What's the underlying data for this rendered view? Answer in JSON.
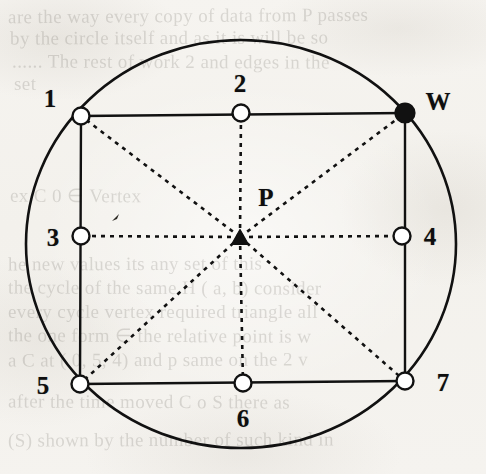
{
  "figure": {
    "canvas": {
      "width": 486,
      "height": 474
    },
    "background_color": "#f5f3ef",
    "ink_color": "#111111",
    "marker_fill_open": "#ffffff",
    "marker_fill_solid": "#111111"
  },
  "geometry": {
    "circle": {
      "cx": 241,
      "cy": 244,
      "rx": 215,
      "ry": 204
    },
    "rectangle": {
      "left": 81,
      "right": 404,
      "top": 115,
      "bottom": 383
    },
    "center_point": {
      "x": 240,
      "y": 237
    }
  },
  "points": [
    {
      "id": "p1",
      "label": "1",
      "marker": "open-circle",
      "x": 81,
      "y": 116,
      "label_x": 50,
      "label_y": 98
    },
    {
      "id": "p2",
      "label": "2",
      "marker": "open-circle",
      "x": 241,
      "y": 113,
      "label_x": 240,
      "label_y": 83
    },
    {
      "id": "pW",
      "label": "W",
      "marker": "filled-circle",
      "x": 405,
      "y": 113,
      "label_x": 438,
      "label_y": 101
    },
    {
      "id": "p3",
      "label": "3",
      "marker": "open-circle",
      "x": 81,
      "y": 236,
      "label_x": 53,
      "label_y": 237
    },
    {
      "id": "p4",
      "label": "4",
      "marker": "open-circle",
      "x": 402,
      "y": 236,
      "label_x": 430,
      "label_y": 236
    },
    {
      "id": "p5",
      "label": "5",
      "marker": "open-circle",
      "x": 80,
      "y": 384,
      "label_x": 43,
      "label_y": 385
    },
    {
      "id": "p6",
      "label": "6",
      "marker": "open-circle",
      "x": 243,
      "y": 383,
      "label_x": 243,
      "label_y": 418
    },
    {
      "id": "p7",
      "label": "7",
      "marker": "open-circle",
      "x": 405,
      "y": 381,
      "label_x": 443,
      "label_y": 382
    }
  ],
  "center_marker": {
    "id": "pP",
    "label": "P",
    "marker": "filled-triangle",
    "x": 240,
    "y": 237,
    "label_x": 266,
    "label_y": 197
  },
  "lines": {
    "solid_description": "circle outline and rectangle perimeter",
    "dashed_description": "eight dashed spokes from P to each boundary point",
    "dashed_pattern": "4 5"
  },
  "bleed_through_text": [
    {
      "text": "are the way every copy of data from P passes",
      "x": 8,
      "y": 6,
      "rotate": "-0.4deg",
      "size": 19
    },
    {
      "text": "by the circle itself and as it is will be so",
      "x": 10,
      "y": 28,
      "rotate": "-0.2deg",
      "size": 19
    },
    {
      "text": "...... The rest of work 2 and edges in the",
      "x": 12,
      "y": 52,
      "rotate": "0.2deg",
      "size": 19
    },
    {
      "text": "set",
      "x": 14,
      "y": 74,
      "rotate": "0deg",
      "size": 19
    },
    {
      "text": "ex C 0 ∈ Vertex",
      "x": 10,
      "y": 186,
      "rotate": "0.3deg",
      "size": 19
    },
    {
      "text": "he new values its any set of this",
      "x": 8,
      "y": 254,
      "rotate": "-0.2deg",
      "size": 19
    },
    {
      "text": "the cycle of the same H ( a, b) consider",
      "x": 8,
      "y": 278,
      "rotate": "0.2deg",
      "size": 19
    },
    {
      "text": "every cycle vertex required triangle all",
      "x": 8,
      "y": 302,
      "rotate": "0deg",
      "size": 19
    },
    {
      "text": "the one form ∈ the relative point is  w",
      "x": 8,
      "y": 326,
      "rotate": "0.25deg",
      "size": 19
    },
    {
      "text": "a C at ( 0, 5, 4) and p same on the 2 v",
      "x": 8,
      "y": 350,
      "rotate": "-0.2deg",
      "size": 19
    },
    {
      "text": "after the time moved C o S there as",
      "x": 8,
      "y": 392,
      "rotate": "0.2deg",
      "size": 19
    },
    {
      "text": "(S) shown by the number of such kind in",
      "x": 8,
      "y": 430,
      "rotate": "-0.2deg",
      "size": 19
    }
  ]
}
